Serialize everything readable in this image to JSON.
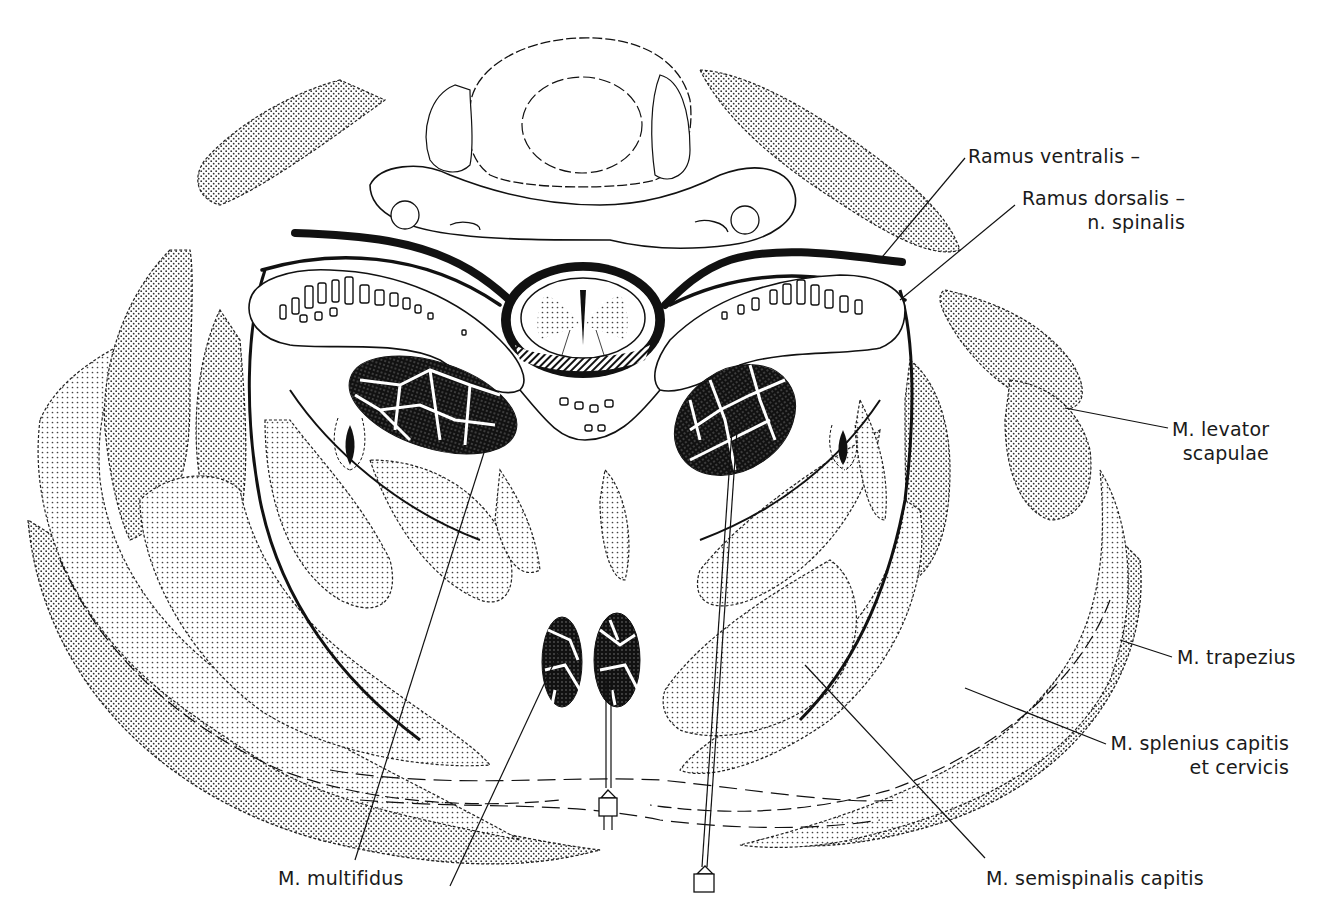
{
  "figure": {
    "type": "anatomical cross-section",
    "colors": {
      "ink": "#111111",
      "stipple": "#333333",
      "background": "#ffffff"
    }
  },
  "labels": [
    {
      "id": "ramus-ventralis",
      "line1": "Ramus ventralis –",
      "line2": "",
      "x": 968,
      "y": 144,
      "align": "left",
      "leader": [
        [
          965,
          158
        ],
        [
          878,
          262
        ]
      ]
    },
    {
      "id": "ramus-dorsalis",
      "line1": "Ramus dorsalis –",
      "line2": "n. spinalis",
      "x": 1022,
      "y": 186,
      "align": "right",
      "leader": [
        [
          1015,
          205
        ],
        [
          900,
          300
        ]
      ]
    },
    {
      "id": "m-levator-scapulae",
      "line1": "M. levator",
      "line2": "scapulae",
      "x": 1172,
      "y": 417,
      "align": "right",
      "leader": [
        [
          1168,
          428
        ],
        [
          1065,
          408
        ]
      ]
    },
    {
      "id": "m-trapezius",
      "line1": "M. trapezius",
      "line2": "",
      "x": 1177,
      "y": 645,
      "align": "left",
      "leader": [
        [
          1172,
          657
        ],
        [
          1120,
          640
        ]
      ]
    },
    {
      "id": "m-splenius-capitis",
      "line1": "M. splenius capitis",
      "line2": "et cervicis",
      "x": 1110,
      "y": 731,
      "align": "right",
      "leader": [
        [
          1106,
          744
        ],
        [
          965,
          688
        ]
      ]
    },
    {
      "id": "m-multifidus",
      "line1": "M. multifidus",
      "line2": "",
      "x": 278,
      "y": 866,
      "align": "left",
      "leader": [
        [
          355,
          860
        ],
        [
          488,
          440
        ]
      ]
    },
    {
      "id": "m-semispinalis-capitis",
      "line1": "M. semispinalis capitis",
      "line2": "",
      "x": 986,
      "y": 866,
      "align": "left",
      "leader": [
        [
          985,
          858
        ],
        [
          805,
          665
        ]
      ]
    }
  ],
  "extra_leaders": [
    {
      "id": "multifidus-second-leader",
      "points": [
        [
          450,
          886
        ],
        [
          560,
          650
        ]
      ]
    }
  ]
}
